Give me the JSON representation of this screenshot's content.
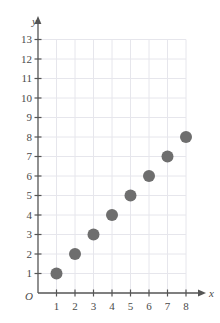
{
  "chart_data": {
    "type": "scatter",
    "title": "",
    "xlabel": "x",
    "ylabel": "y",
    "origin_label": "O",
    "x": [
      1,
      2,
      3,
      4,
      5,
      6,
      7,
      8
    ],
    "y": [
      1,
      2,
      3,
      4,
      5,
      6,
      7,
      8
    ],
    "points": [
      {
        "x": 1,
        "y": 1
      },
      {
        "x": 2,
        "y": 2
      },
      {
        "x": 3,
        "y": 3
      },
      {
        "x": 4,
        "y": 4
      },
      {
        "x": 5,
        "y": 5
      },
      {
        "x": 6,
        "y": 6
      },
      {
        "x": 7,
        "y": 7
      },
      {
        "x": 8,
        "y": 8
      }
    ],
    "xlim": [
      0,
      8
    ],
    "ylim": [
      0,
      13
    ],
    "xticks": [
      1,
      2,
      3,
      4,
      5,
      6,
      7,
      8
    ],
    "yticks": [
      1,
      2,
      3,
      4,
      5,
      6,
      7,
      8,
      9,
      10,
      11,
      12,
      13
    ],
    "xtick_labels": [
      "1",
      "2",
      "3",
      "4",
      "5",
      "6",
      "7",
      "8"
    ],
    "ytick_labels": [
      "1",
      "2",
      "3",
      "4",
      "5",
      "6",
      "7",
      "8",
      "9",
      "10",
      "11",
      "12",
      "13"
    ],
    "grid": true,
    "legend": null,
    "marker": "circle",
    "marker_color": "#6e6e6e",
    "marker_radius_px": 6,
    "grid_color": "#e6e6ec",
    "axis_color": "#555555",
    "text_color": "#4a4a4a",
    "x_axis_arrow": true,
    "y_axis_arrow": true
  }
}
